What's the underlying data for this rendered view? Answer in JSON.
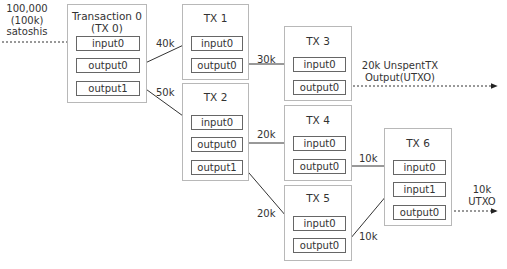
{
  "source": {
    "lines": [
      "100,000",
      "(100k)",
      "satoshis"
    ]
  },
  "transactions": {
    "tx0": {
      "title_lines": [
        "Transaction 0",
        "(TX 0)"
      ],
      "slots": [
        "input0",
        "output0",
        "output1"
      ]
    },
    "tx1": {
      "title": "TX 1",
      "slots": [
        "input0",
        "output0"
      ]
    },
    "tx2": {
      "title": "TX 2",
      "slots": [
        "input0",
        "output0",
        "output1"
      ]
    },
    "tx3": {
      "title": "TX 3",
      "slots": [
        "input0",
        "output0"
      ]
    },
    "tx4": {
      "title": "TX 4",
      "slots": [
        "input0",
        "output0"
      ]
    },
    "tx5": {
      "title": "TX 5",
      "slots": [
        "input0",
        "output0"
      ]
    },
    "tx6": {
      "title": "TX 6",
      "slots": [
        "input0",
        "input1",
        "output0"
      ]
    }
  },
  "edges": [
    {
      "from": "tx0.output0",
      "to": "tx1.input0",
      "amount": "40k"
    },
    {
      "from": "tx0.output1",
      "to": "tx2.input0",
      "amount": "50k"
    },
    {
      "from": "tx1.output0",
      "to": "tx3.input0",
      "amount": "30k"
    },
    {
      "from": "tx2.output0",
      "to": "tx4.input0",
      "amount": "20k"
    },
    {
      "from": "tx2.output1",
      "to": "tx5.input0",
      "amount": "20k"
    },
    {
      "from": "tx4.output0",
      "to": "tx6.input0",
      "amount": "10k"
    },
    {
      "from": "tx5.output0",
      "to": "tx6.input1",
      "amount": "10k"
    }
  ],
  "utxo": {
    "tx3": {
      "lines": [
        "20k UnspentTX",
        "Output(UTXO)"
      ]
    },
    "tx6": {
      "lines": [
        "10k",
        "UTXO"
      ]
    }
  },
  "colors": {
    "box_border": "#b8b8b8",
    "slot_border": "#666666",
    "line": "#333333",
    "text": "#333333"
  }
}
